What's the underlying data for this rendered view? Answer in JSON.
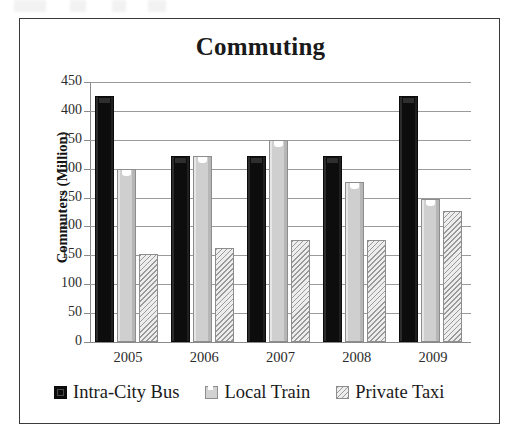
{
  "chart_data": {
    "type": "bar",
    "title": "Commuting",
    "xlabel": "",
    "ylabel": "Commuters (Million)",
    "categories": [
      "2005",
      "2006",
      "2007",
      "2008",
      "2009"
    ],
    "series": [
      {
        "name": "Intra-City Bus",
        "values": [
          425,
          322,
          322,
          322,
          425
        ],
        "color": "#0d0d0d",
        "fill": "solid-black"
      },
      {
        "name": "Local Train",
        "values": [
          300,
          322,
          350,
          277,
          248
        ],
        "color": "#d2d2d2",
        "fill": "solid-light-gray"
      },
      {
        "name": "Private Taxi",
        "values": [
          152,
          163,
          177,
          176,
          227
        ],
        "color": "#d8d8d8",
        "fill": "diagonal-hatch"
      }
    ],
    "ylim": [
      0,
      450
    ],
    "ytick_step": 50,
    "yticks": [
      "450",
      "400",
      "350",
      "300",
      "250",
      "200",
      "150",
      "100",
      "50",
      "0"
    ],
    "grid": true,
    "legend_position": "bottom"
  },
  "legend": {
    "items": [
      {
        "label": "Intra-City Bus",
        "swatch": "bus"
      },
      {
        "label": "Local Train",
        "swatch": "train"
      },
      {
        "label": "Private Taxi",
        "swatch": "taxi"
      }
    ]
  }
}
